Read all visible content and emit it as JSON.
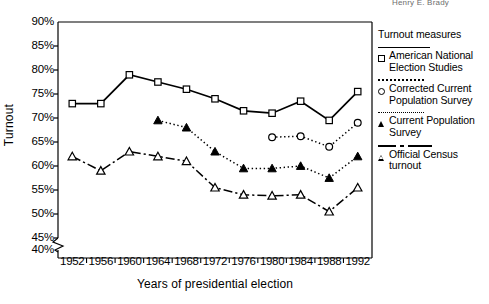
{
  "page": {
    "running_header": "Henry E. Brady"
  },
  "chart_data": {
    "type": "line",
    "title": "",
    "xlabel": "Years of presidential election",
    "ylabel": "Turnout",
    "x": [
      1952,
      1956,
      1960,
      1964,
      1968,
      1972,
      1976,
      1980,
      1984,
      1988,
      1992
    ],
    "xtick_labels": [
      "1952",
      "1956",
      "1960",
      "1964",
      "1968",
      "1972",
      "1976",
      "1980",
      "1984",
      "1988",
      "1992"
    ],
    "ylim": [
      40,
      90
    ],
    "ytick_labels": [
      "90%",
      "85%",
      "80%",
      "75%",
      "70%",
      "65%",
      "60%",
      "55%",
      "50%",
      "45%",
      "40%"
    ],
    "ytick_values": [
      90,
      85,
      80,
      75,
      70,
      65,
      60,
      55,
      50,
      45,
      40
    ],
    "yaxis_break": true,
    "yaxis_break_between": [
      40,
      45
    ],
    "grid": false,
    "legend_position": "right",
    "legend_title": "Turnout measures",
    "series": [
      {
        "name": "American National Election Studies",
        "marker": "open-square",
        "line": "solid",
        "x": [
          1952,
          1956,
          1960,
          1964,
          1968,
          1972,
          1976,
          1980,
          1984,
          1988,
          1992
        ],
        "values": [
          73.0,
          73.0,
          79.0,
          77.5,
          76.0,
          74.0,
          71.5,
          71.0,
          73.5,
          69.5,
          75.5
        ]
      },
      {
        "name": "Corrected Current Population Survey",
        "marker": "open-circle",
        "line": "dotted",
        "x": [
          1980,
          1984,
          1988,
          1992
        ],
        "values": [
          66.0,
          66.2,
          64.0,
          69.0
        ]
      },
      {
        "name": "Current Population Survey",
        "marker": "filled-triangle",
        "line": "dotted",
        "x": [
          1964,
          1968,
          1972,
          1976,
          1980,
          1984,
          1988,
          1992
        ],
        "values": [
          69.5,
          68.0,
          63.0,
          59.5,
          59.5,
          60.0,
          57.5,
          62.0
        ]
      },
      {
        "name": "Official Census turnout",
        "marker": "open-triangle",
        "line": "dash-dot",
        "x": [
          1952,
          1956,
          1960,
          1964,
          1968,
          1972,
          1976,
          1980,
          1984,
          1988,
          1992
        ],
        "values": [
          62.0,
          59.0,
          63.0,
          62.0,
          61.0,
          55.5,
          54.0,
          53.8,
          54.0,
          50.5,
          55.5
        ]
      }
    ]
  },
  "legend": {
    "title": "Turnout measures",
    "entries": [
      {
        "label": "American National Election Studies",
        "marker": "open-square",
        "line": "solid"
      },
      {
        "label": "Corrected Current Population Survey",
        "marker": "open-circle",
        "line": "dotted"
      },
      {
        "label": "Current Population Survey",
        "marker": "filled-triangle",
        "line": "dotted"
      },
      {
        "label": "Official Census turnout",
        "marker": "open-triangle",
        "line": "dash-dot"
      }
    ]
  }
}
